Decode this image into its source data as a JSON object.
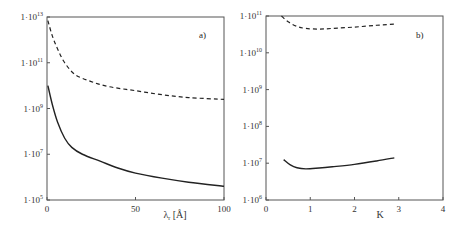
{
  "chart_data": [
    {
      "type": "line",
      "panel_label": "a)",
      "xlabel": "λ_r [Å]",
      "xlabel_main": "λ",
      "xlabel_sub": "r",
      "xlabel_unit": " [Å]",
      "ylabel": "",
      "yscale": "log",
      "xlim": [
        0,
        100
      ],
      "ylim": [
        100000.0,
        10000000000000.0
      ],
      "xticks": [
        0,
        50,
        100
      ],
      "xtick_labels": [
        "0",
        "50",
        "100"
      ],
      "yticks": [
        100000.0,
        10000000.0,
        1000000000.0,
        100000000000.0,
        10000000000000.0
      ],
      "ytick_labels": [
        {
          "base": "1·10",
          "exp": "5"
        },
        {
          "base": "1·10",
          "exp": "7"
        },
        {
          "base": "1·10",
          "exp": "9"
        },
        {
          "base": "1·10",
          "exp": "11"
        },
        {
          "base": "1·10",
          "exp": "13"
        }
      ],
      "grid": false,
      "series": [
        {
          "name": "dashed",
          "style": "dashed",
          "x": [
            0.5,
            3,
            6,
            10,
            16,
            25,
            35,
            50,
            65,
            80,
            100
          ],
          "y": [
            7000000000000.0,
            1500000000000.0,
            400000000000.0,
            100000000000.0,
            30000000000.0,
            15000000000.0,
            9000000000.0,
            6000000000.0,
            4000000000.0,
            3000000000.0,
            2500000000.0
          ]
        },
        {
          "name": "solid",
          "style": "solid",
          "x": [
            0.5,
            3,
            6,
            10,
            14,
            20,
            30,
            40,
            50,
            65,
            80,
            100
          ],
          "y": [
            10000000000.0,
            1500000000.0,
            250000000.0,
            50000000.0,
            20000000.0,
            10000000.0,
            5000000.0,
            2500000.0,
            1500000.0,
            900000.0,
            600000.0,
            400000.0
          ]
        }
      ]
    },
    {
      "type": "line",
      "panel_label": "b)",
      "xlabel": "K",
      "ylabel": "",
      "yscale": "log",
      "xlim": [
        0,
        4
      ],
      "ylim": [
        1000000.0,
        100000000000.0
      ],
      "xticks": [
        0,
        1,
        2,
        3,
        4
      ],
      "xtick_labels": [
        "0",
        "1",
        "2",
        "3",
        "4"
      ],
      "yticks": [
        1000000.0,
        10000000.0,
        100000000.0,
        1000000000.0,
        10000000000.0,
        100000000000.0
      ],
      "ytick_labels": [
        {
          "base": "1·10",
          "exp": "6"
        },
        {
          "base": "1·10",
          "exp": "7"
        },
        {
          "base": "1·10",
          "exp": "8"
        },
        {
          "base": "1·10",
          "exp": "9"
        },
        {
          "base": "1·10",
          "exp": "10"
        },
        {
          "base": "1·10",
          "exp": "11"
        }
      ],
      "grid": false,
      "series": [
        {
          "name": "dashed",
          "style": "dashed",
          "x": [
            0.35,
            0.5,
            0.7,
            0.9,
            1.2,
            1.5,
            2.0,
            2.5,
            2.9
          ],
          "y": [
            100000000000.0,
            70000000000.0,
            52000000000.0,
            46000000000.0,
            44000000000.0,
            46000000000.0,
            50000000000.0,
            56000000000.0,
            60000000000.0
          ]
        },
        {
          "name": "solid",
          "style": "solid",
          "x": [
            0.4,
            0.55,
            0.7,
            0.9,
            1.2,
            1.5,
            2.0,
            2.5,
            2.9
          ],
          "y": [
            12500000.0,
            9000000.0,
            7500000.0,
            7000000.0,
            7400000.0,
            8000000.0,
            9300000.0,
            11500000.0,
            14000000.0
          ]
        }
      ]
    }
  ]
}
